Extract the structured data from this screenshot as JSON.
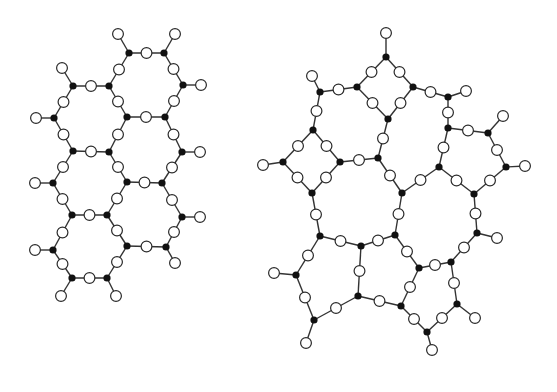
{
  "figure": {
    "width": 557,
    "height": 392,
    "colors": {
      "background": "#ffffff",
      "bond": "#333333",
      "cation_fill": "#111111",
      "anion_fill": "#ffffff",
      "anion_stroke": "#2a2a2a"
    },
    "cation_radius": 3.6,
    "anion_radius": 5.4,
    "bond_width": 1.4
  },
  "panels": [
    {
      "name": "crystalline-network",
      "cations": [
        [
          129,
          53
        ],
        [
          164,
          53
        ],
        [
          73,
          86
        ],
        [
          109,
          86
        ],
        [
          183,
          85
        ],
        [
          54,
          118
        ],
        [
          127,
          117
        ],
        [
          165,
          117
        ],
        [
          73,
          151
        ],
        [
          109,
          152
        ],
        [
          182,
          152
        ],
        [
          53,
          183
        ],
        [
          127,
          182
        ],
        [
          162,
          183
        ],
        [
          72,
          215
        ],
        [
          107,
          215
        ],
        [
          182,
          217
        ],
        [
          53,
          250
        ],
        [
          127,
          246
        ],
        [
          166,
          247
        ],
        [
          72,
          278
        ],
        [
          107,
          278
        ]
      ],
      "bonds": [
        [
          0,
          1
        ],
        [
          0,
          3
        ],
        [
          1,
          4
        ],
        [
          2,
          3
        ],
        [
          2,
          5
        ],
        [
          3,
          6
        ],
        [
          4,
          7
        ],
        [
          6,
          7
        ],
        [
          5,
          8
        ],
        [
          6,
          9
        ],
        [
          7,
          10
        ],
        [
          8,
          9
        ],
        [
          8,
          11
        ],
        [
          9,
          12
        ],
        [
          10,
          13
        ],
        [
          12,
          13
        ],
        [
          11,
          14
        ],
        [
          12,
          15
        ],
        [
          13,
          16
        ],
        [
          14,
          15
        ],
        [
          14,
          17
        ],
        [
          15,
          18
        ],
        [
          16,
          19
        ],
        [
          18,
          19
        ],
        [
          17,
          20
        ],
        [
          18,
          21
        ],
        [
          20,
          21
        ]
      ],
      "terminals": [
        [
          0,
          118,
          34
        ],
        [
          1,
          175,
          34
        ],
        [
          2,
          62,
          68
        ],
        [
          4,
          201,
          85
        ],
        [
          5,
          36,
          118
        ],
        [
          10,
          200,
          152
        ],
        [
          11,
          35,
          183
        ],
        [
          16,
          200,
          217
        ],
        [
          17,
          35,
          250
        ],
        [
          19,
          175,
          263
        ],
        [
          20,
          61,
          296
        ],
        [
          21,
          116,
          296
        ]
      ]
    },
    {
      "name": "amorphous-network",
      "cations": [
        [
          386,
          57
        ],
        [
          357,
          87
        ],
        [
          413,
          87
        ],
        [
          320,
          92
        ],
        [
          448,
          97
        ],
        [
          388,
          119
        ],
        [
          313,
          130
        ],
        [
          448,
          128
        ],
        [
          488,
          133
        ],
        [
          283,
          162
        ],
        [
          340,
          162
        ],
        [
          378,
          158
        ],
        [
          439,
          167
        ],
        [
          506,
          167
        ],
        [
          312,
          193
        ],
        [
          402,
          193
        ],
        [
          474,
          194
        ],
        [
          320,
          236
        ],
        [
          361,
          246
        ],
        [
          395,
          235
        ],
        [
          477,
          233
        ],
        [
          296,
          275
        ],
        [
          419,
          268
        ],
        [
          451,
          262
        ],
        [
          358,
          296
        ],
        [
          401,
          306
        ],
        [
          457,
          304
        ],
        [
          314,
          320
        ],
        [
          427,
          332
        ]
      ],
      "bonds": [
        [
          0,
          1
        ],
        [
          0,
          2
        ],
        [
          1,
          3
        ],
        [
          1,
          5
        ],
        [
          2,
          5
        ],
        [
          2,
          4
        ],
        [
          3,
          6
        ],
        [
          4,
          7
        ],
        [
          6,
          9
        ],
        [
          6,
          10
        ],
        [
          5,
          11
        ],
        [
          10,
          11
        ],
        [
          7,
          8
        ],
        [
          7,
          12
        ],
        [
          8,
          13
        ],
        [
          9,
          14
        ],
        [
          10,
          14
        ],
        [
          11,
          15
        ],
        [
          12,
          15
        ],
        [
          12,
          16
        ],
        [
          13,
          16
        ],
        [
          14,
          17
        ],
        [
          15,
          19
        ],
        [
          16,
          20
        ],
        [
          17,
          18
        ],
        [
          18,
          19
        ],
        [
          17,
          21
        ],
        [
          18,
          24
        ],
        [
          19,
          22
        ],
        [
          20,
          23
        ],
        [
          22,
          23
        ],
        [
          22,
          25
        ],
        [
          23,
          26
        ],
        [
          21,
          27
        ],
        [
          24,
          25
        ],
        [
          24,
          27
        ],
        [
          25,
          28
        ],
        [
          26,
          28
        ]
      ],
      "terminals": [
        [
          0,
          386,
          33
        ],
        [
          3,
          312,
          76
        ],
        [
          4,
          466,
          91
        ],
        [
          8,
          503,
          116
        ],
        [
          9,
          263,
          165
        ],
        [
          13,
          525,
          166
        ],
        [
          20,
          497,
          238
        ],
        [
          21,
          274,
          273
        ],
        [
          26,
          475,
          318
        ],
        [
          27,
          306,
          343
        ],
        [
          28,
          432,
          350
        ]
      ]
    }
  ]
}
